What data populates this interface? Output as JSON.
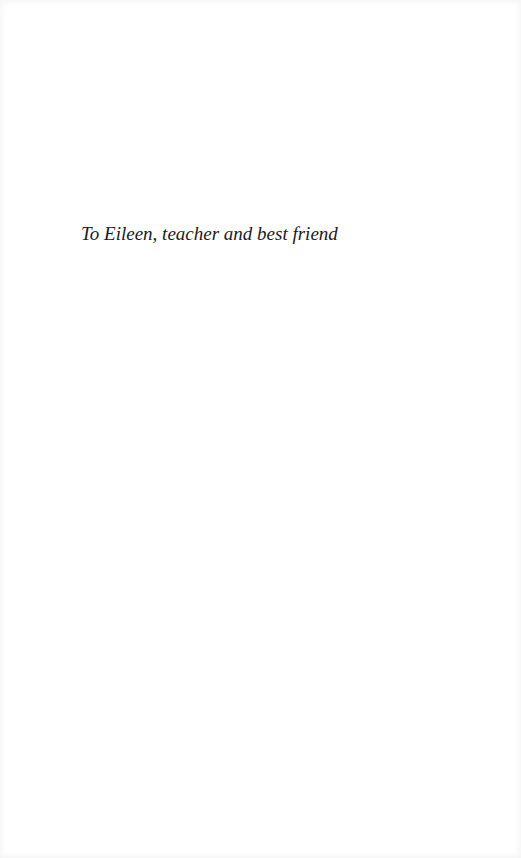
{
  "page": {
    "dedication": "To Eileen, teacher and best friend"
  }
}
